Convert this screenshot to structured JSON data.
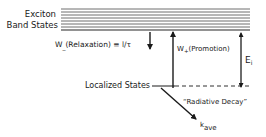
{
  "diagram": {
    "band": {
      "label_line1": "Exciton",
      "label_line2": "Band States",
      "line_count": 8
    },
    "relaxation": {
      "label_w": "W",
      "label_sub": "_",
      "label_rest": "(Relaxation) ≡ l/τ"
    },
    "promotion": {
      "label_w": "W",
      "label_sub": "+",
      "label_rest": "(Promotion)"
    },
    "energy_gap": {
      "label_e": "E",
      "label_sub": "i"
    },
    "localized": {
      "label": "Localized States"
    },
    "radiative": {
      "label": "“Radiative Decay”",
      "rate_k": "k",
      "rate_sub": "ave"
    },
    "colors": {
      "ink": "#1a1a1a",
      "band_line": "#6e6e6e"
    }
  }
}
